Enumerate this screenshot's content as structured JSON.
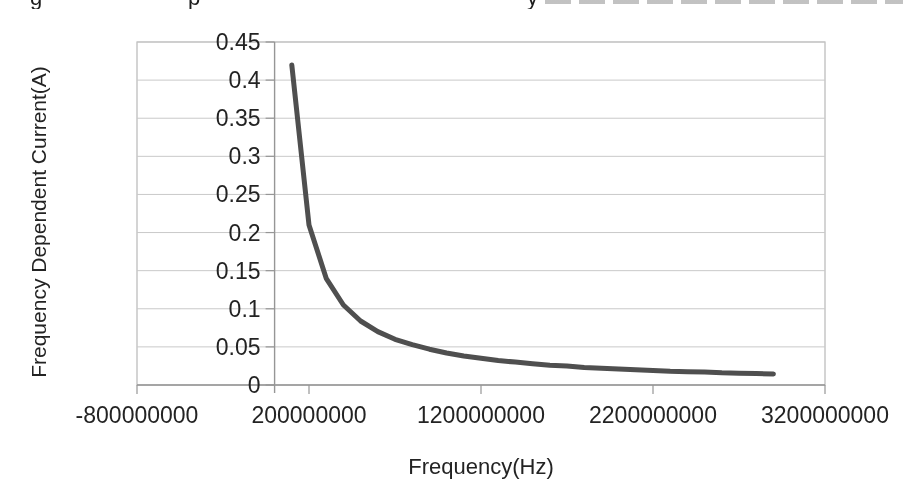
{
  "page": {
    "background": "#ffffff",
    "cropped_top_text_fragments": [
      {
        "glyph": "g",
        "x": 30
      },
      {
        "glyph": "p",
        "x": 188
      },
      {
        "glyph": "y",
        "x": 527
      }
    ]
  },
  "style": {
    "curve_color": "#4f4f4f",
    "grid_color": "#c9c9c9",
    "border_color": "#b8b8b8",
    "axis_color": "#969696",
    "text_color": "#232323"
  },
  "chart_data": {
    "type": "line",
    "title": "",
    "xlabel": "Frequency(Hz)",
    "ylabel": "Frequency Dependent Current(A)",
    "xlim": [
      -800000000,
      3200000000
    ],
    "ylim": [
      0,
      0.45
    ],
    "grid": true,
    "legend": false,
    "x_ticks": [
      {
        "value": -800000000,
        "label": "-800000000"
      },
      {
        "value": 200000000,
        "label": "200000000"
      },
      {
        "value": 1200000000,
        "label": "1200000000"
      },
      {
        "value": 2200000000,
        "label": "2200000000"
      },
      {
        "value": 3200000000,
        "label": "3200000000"
      }
    ],
    "y_ticks": [
      {
        "value": 0,
        "label": "0"
      },
      {
        "value": 0.05,
        "label": "0.05"
      },
      {
        "value": 0.1,
        "label": "0.1"
      },
      {
        "value": 0.15,
        "label": "0.15"
      },
      {
        "value": 0.2,
        "label": "0.2"
      },
      {
        "value": 0.25,
        "label": "0.25"
      },
      {
        "value": 0.3,
        "label": "0.3"
      },
      {
        "value": 0.35,
        "label": "0.35"
      },
      {
        "value": 0.4,
        "label": "0.4"
      },
      {
        "value": 0.45,
        "label": "0.45"
      }
    ],
    "series": [
      {
        "name": "Frequency Dependent Current",
        "color": "#4f4f4f",
        "x": [
          100000000,
          200000000,
          300000000,
          400000000,
          500000000,
          600000000,
          700000000,
          800000000,
          900000000,
          1000000000,
          1100000000,
          1200000000,
          1300000000,
          1400000000,
          1500000000,
          1600000000,
          1700000000,
          1800000000,
          1900000000,
          2000000000,
          2100000000,
          2200000000,
          2300000000,
          2400000000,
          2500000000,
          2600000000,
          2700000000,
          2800000000,
          2900000000
        ],
        "y": [
          0.42,
          0.21,
          0.14,
          0.105,
          0.084,
          0.07,
          0.06,
          0.053,
          0.047,
          0.042,
          0.038,
          0.035,
          0.032,
          0.03,
          0.028,
          0.026,
          0.025,
          0.023,
          0.022,
          0.021,
          0.02,
          0.019,
          0.018,
          0.0175,
          0.017,
          0.016,
          0.0155,
          0.015,
          0.0145
        ]
      }
    ]
  }
}
